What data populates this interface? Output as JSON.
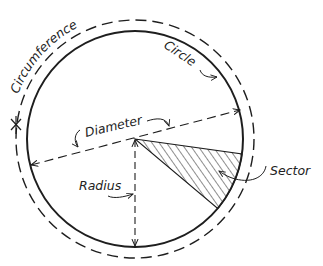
{
  "diagram": {
    "type": "circle-parts",
    "colors": {
      "ink": "#1e1e1e",
      "background": "#ffffff"
    },
    "labels": {
      "circumference": "Circumference",
      "circle": "Circle",
      "diameter": "Diameter",
      "radius": "Radius",
      "sector": "Sector"
    },
    "geometry": {
      "center": [
        135,
        139
      ],
      "circle_radius": 108,
      "circumference_radius": 119,
      "sector_angles_deg": [
        8,
        40
      ]
    }
  }
}
